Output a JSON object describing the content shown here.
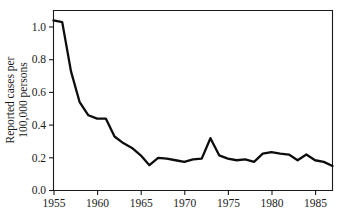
{
  "chart_data": {
    "type": "line",
    "title": "",
    "xlabel": "",
    "ylabel_line1": "Reported cases per",
    "ylabel_line2": "100,000 persons",
    "ylabel": "Reported cases per 100,000 persons",
    "xlim": [
      1955,
      1987
    ],
    "ylim": [
      0.0,
      1.1
    ],
    "grid": false,
    "legend": "none",
    "x_tick_labels": [
      "1955",
      "1960",
      "1965",
      "1970",
      "1975",
      "1980",
      "1985"
    ],
    "x_tick_values": [
      1955,
      1960,
      1965,
      1970,
      1975,
      1980,
      1985
    ],
    "y_tick_labels": [
      "0.0",
      "0.2",
      "0.4",
      "0.6",
      "0.8",
      "1.0"
    ],
    "y_tick_values": [
      0.0,
      0.2,
      0.4,
      0.6,
      0.8,
      1.0
    ],
    "series": [
      {
        "name": "Reported cases per 100,000 persons",
        "color": "#0d0d0d",
        "x": [
          1955,
          1956,
          1957,
          1958,
          1959,
          1960,
          1961,
          1962,
          1963,
          1964,
          1965,
          1966,
          1967,
          1968,
          1969,
          1970,
          1971,
          1972,
          1973,
          1974,
          1975,
          1976,
          1977,
          1978,
          1979,
          1980,
          1981,
          1982,
          1983,
          1984,
          1985,
          1986,
          1987
        ],
        "values": [
          1.04,
          1.03,
          0.73,
          0.54,
          0.46,
          0.44,
          0.44,
          0.33,
          0.29,
          0.26,
          0.215,
          0.155,
          0.2,
          0.195,
          0.185,
          0.175,
          0.19,
          0.195,
          0.32,
          0.215,
          0.195,
          0.185,
          0.19,
          0.175,
          0.225,
          0.235,
          0.225,
          0.22,
          0.185,
          0.22,
          0.185,
          0.175,
          0.15
        ]
      }
    ],
    "annotations": []
  },
  "figure": {
    "background_color": "#ffffff",
    "line_color": "#0d0d0d",
    "axis_color": "#1a1a1a"
  }
}
